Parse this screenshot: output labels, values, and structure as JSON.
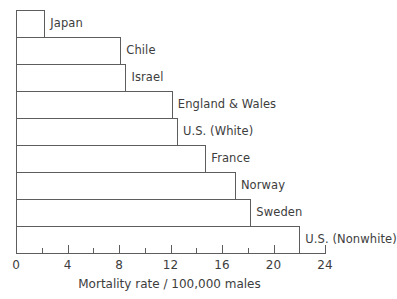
{
  "chart_data": {
    "type": "bar",
    "orientation": "horizontal",
    "title": "",
    "subtitle": "",
    "xlabel": "Mortality rate  /  100,000 males",
    "ylabel": "",
    "categories": [
      "Japan",
      "Chile",
      "Israel",
      "England & Wales",
      "U.S. (White)",
      "France",
      "Norway",
      "Sweden",
      "U.S. (Nonwhite)"
    ],
    "values": [
      2.2,
      8.1,
      8.5,
      12.1,
      12.5,
      14.7,
      17.0,
      18.2,
      22.0
    ],
    "xlim": [
      0,
      24
    ],
    "xticks": [
      0,
      2,
      4,
      6,
      8,
      10,
      12,
      14,
      16,
      18,
      20,
      22,
      24
    ],
    "xtick_labels": [
      "0",
      "",
      "4",
      "",
      "8",
      "",
      "12",
      "",
      "16",
      "",
      "20",
      "",
      "24"
    ],
    "grid": false,
    "legend": null,
    "legend_position": "none",
    "bar_fill_color": "#ffffff",
    "bar_edge_color": "#5d5d5d",
    "axis_color": "#5d5d5d",
    "text_color": "#3d3d3d",
    "background_color": "#ffffff",
    "annotations": []
  },
  "axis": {
    "title": "Mortality rate  /  100,000 males"
  }
}
